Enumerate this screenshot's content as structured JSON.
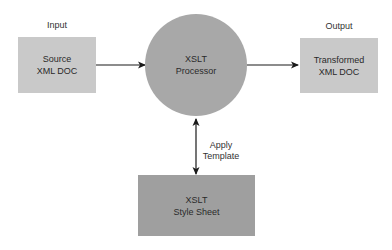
{
  "diagram": {
    "type": "flow",
    "colors": {
      "io_box": "#c9c9c9",
      "processor": "#a8a8a8",
      "stylesheet": "#9f9f9f",
      "line": "#1a1a1a"
    },
    "nodes": {
      "source": {
        "caption": "Input",
        "line1": "Source",
        "line2": "XML DOC"
      },
      "processor": {
        "line1": "XSLT",
        "line2": "Processor"
      },
      "output": {
        "caption": "Output",
        "line1": "Transformed",
        "line2": "XML DOC"
      },
      "stylesheet": {
        "line1": "XSLT",
        "line2": "Style Sheet"
      }
    },
    "edges": {
      "source_to_processor": {
        "from": "source",
        "to": "processor"
      },
      "processor_to_output": {
        "from": "processor",
        "to": "output"
      },
      "processor_stylesheet": {
        "from": "processor",
        "to": "stylesheet",
        "bidirectional": true,
        "line1": "Apply",
        "line2": "Template"
      }
    }
  }
}
